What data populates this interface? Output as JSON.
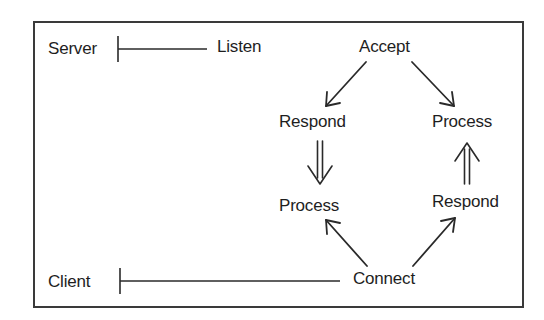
{
  "diagram": {
    "title": "",
    "roles": {
      "server": "Server",
      "client": "Client"
    },
    "nodes": {
      "listen": "Listen",
      "accept": "Accept",
      "server_respond": "Respond",
      "server_process": "Process",
      "client_process": "Process",
      "client_respond": "Respond",
      "connect": "Connect"
    },
    "edges": [
      {
        "from": "Server",
        "to": "Listen",
        "style": "timeline"
      },
      {
        "from": "Client",
        "to": "Connect",
        "style": "timeline"
      },
      {
        "from": "Accept",
        "to": "Respond (server)",
        "style": "arrow"
      },
      {
        "from": "Accept",
        "to": "Process (server)",
        "style": "arrow"
      },
      {
        "from": "Respond (server)",
        "to": "Process (client)",
        "style": "double-arrow"
      },
      {
        "from": "Respond (client)",
        "to": "Process (server)",
        "style": "double-arrow"
      },
      {
        "from": "Connect",
        "to": "Process (client)",
        "style": "arrow"
      },
      {
        "from": "Connect",
        "to": "Respond (client)",
        "style": "arrow"
      }
    ],
    "colors": {
      "ink": "#1e1e1e",
      "frame": "#3a3a3a",
      "background": "#ffffff"
    }
  }
}
